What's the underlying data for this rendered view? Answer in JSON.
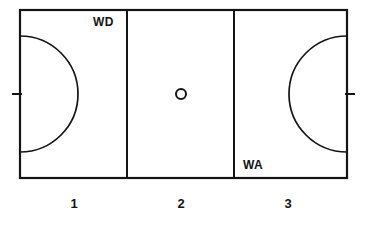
{
  "diagram": {
    "type": "netball-court",
    "background_color": "#ffffff",
    "line_color": "#141414"
  },
  "court": {
    "left": 20,
    "top": 10,
    "right": 347,
    "bottom": 178,
    "width": 327,
    "height": 168,
    "divider_x": [
      127,
      234
    ]
  },
  "goal_circles": {
    "radius": 58,
    "left_center": {
      "x": 20,
      "y": 94
    },
    "right_center": {
      "x": 347,
      "y": 94
    },
    "left_arc_top_y": 36,
    "left_arc_bottom_y": 152
  },
  "center_circle": {
    "cx": 181,
    "cy": 94,
    "r": 5
  },
  "goal_posts": [
    {
      "name": "left-goal-post",
      "x1": 12,
      "x2": 22,
      "y": 94
    },
    {
      "name": "right-goal-post",
      "x1": 345,
      "x2": 355,
      "y": 94
    }
  ],
  "position_labels": [
    {
      "id": "wd",
      "text": "WD",
      "third": 1,
      "placement": "top-right"
    },
    {
      "id": "wa",
      "text": "WA",
      "third": 3,
      "placement": "bottom-left"
    }
  ],
  "third_numbers": [
    {
      "id": "num-1",
      "text": "1"
    },
    {
      "id": "num-2",
      "text": "2"
    },
    {
      "id": "num-3",
      "text": "3"
    }
  ]
}
